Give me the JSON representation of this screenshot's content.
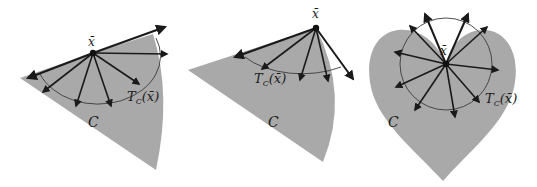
{
  "figure": {
    "panels": [
      {
        "id": "panel-1",
        "point_label": "x̄",
        "tangent_cone_label": "T",
        "tangent_cone_sub": "C",
        "tangent_cone_arg": "(x̄)",
        "set_label": "C"
      },
      {
        "id": "panel-2",
        "point_label": "x̄",
        "tangent_cone_label": "T",
        "tangent_cone_sub": "C",
        "tangent_cone_arg": "(x̄)",
        "set_label": "C"
      },
      {
        "id": "panel-3",
        "point_label": "x̄",
        "tangent_cone_label": "T",
        "tangent_cone_sub": "C",
        "tangent_cone_arg": "(x̄)",
        "set_label": "C"
      }
    ],
    "colors": {
      "set_fill": "#a9a9a9",
      "arrow": "#1a1a1a",
      "arc": "#3a3a3a",
      "background": "#ffffff"
    }
  }
}
